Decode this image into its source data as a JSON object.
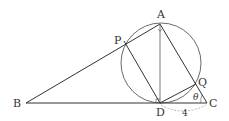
{
  "diagram": {
    "points": {
      "A": {
        "label": "A",
        "x": 160,
        "y": 24
      },
      "P": {
        "label": "P",
        "x": 124,
        "y": 41
      },
      "B": {
        "label": "B",
        "x": 26,
        "y": 103
      },
      "D": {
        "label": "D",
        "x": 160,
        "y": 103
      },
      "C": {
        "label": "C",
        "x": 207,
        "y": 103
      },
      "Q": {
        "label": "Q",
        "x": 196,
        "y": 84
      }
    },
    "circle": {
      "cx": 161,
      "cy": 63,
      "r": 40
    },
    "angle_label": "θ",
    "length_label": "4",
    "segments": [
      "AB",
      "BC",
      "AC",
      "AD",
      "PD",
      "DQ"
    ],
    "right_angle_marks": [
      "D"
    ],
    "colors": {
      "stroke": "#333333",
      "dashed": "#999999",
      "background": "#ffffff"
    }
  }
}
